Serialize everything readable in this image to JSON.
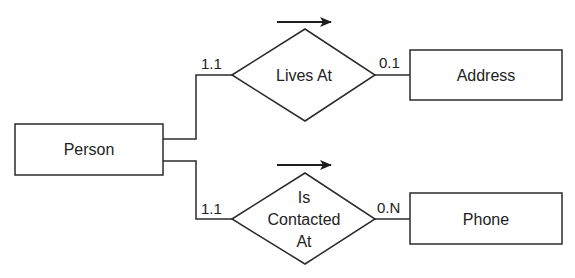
{
  "diagram": {
    "type": "entity-relationship",
    "stroke_color": "#2b2b2b",
    "background": "#ffffff",
    "entities": [
      {
        "id": "person",
        "label": "Person"
      },
      {
        "id": "address",
        "label": "Address"
      },
      {
        "id": "phone",
        "label": "Phone"
      }
    ],
    "relationships": [
      {
        "id": "lives_at",
        "label_lines": [
          "Lives At"
        ],
        "from": "person",
        "to": "address",
        "from_cardinality": "1.1",
        "to_cardinality": "0.1",
        "direction_arrow": "right"
      },
      {
        "id": "is_contacted_at",
        "label_lines": [
          "Is",
          "Contacted",
          "At"
        ],
        "from": "person",
        "to": "phone",
        "from_cardinality": "1.1",
        "to_cardinality": "0.N",
        "direction_arrow": "right"
      }
    ]
  }
}
